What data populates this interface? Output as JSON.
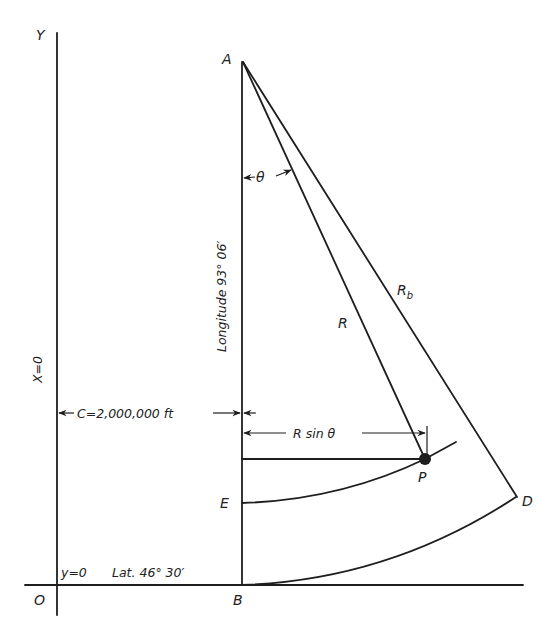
{
  "diagram": {
    "type": "geometric construction - Lambert conformal projection state plane coordinates",
    "axes": {
      "y_axis_label": "Y",
      "origin_label": "O",
      "x_zero_label": "X=0",
      "y_zero_label": "y=0",
      "latitude_label": "Lat. 46° 30′"
    },
    "points": {
      "apex": "A",
      "base": "B",
      "point_e": "E",
      "point_p": "P",
      "point_d": "D"
    },
    "meridian": {
      "label": "Longitude 93° 06′"
    },
    "radii": {
      "r_label": "R",
      "rb_label": "R",
      "rb_subscript": "b"
    },
    "angle": {
      "label": "θ"
    },
    "dimensions": {
      "c_label": "C=2,000,000 ft",
      "r_sin_label": "R sin θ"
    },
    "colors": {
      "ink": "#1e1e1e",
      "background": "#ffffff"
    }
  }
}
